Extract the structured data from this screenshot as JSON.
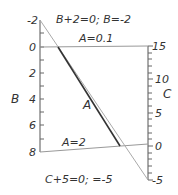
{
  "diagram": {
    "type": "nomogram",
    "left_axis": {
      "name": "B",
      "ticks": [
        "-2",
        "0",
        "2",
        "4",
        "6",
        "8"
      ],
      "min": -2,
      "max": 8
    },
    "right_axis": {
      "name": "C",
      "ticks": [
        "15",
        "10",
        "5",
        "0",
        "-5"
      ],
      "min": -5,
      "max": 15
    },
    "middle_scale": {
      "name": "A",
      "top_label": "A=0.1",
      "bottom_label": "A=2"
    },
    "annotations": {
      "top": "B+2=0; B=-2",
      "bottom": "C+5=0; =-5"
    },
    "colors": {
      "axis": "#555555",
      "dark_line": "#333333",
      "light_line": "#aaaaaa",
      "text": "#333333"
    }
  }
}
